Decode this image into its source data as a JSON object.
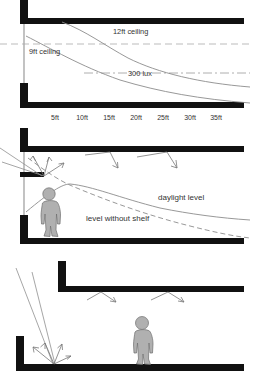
{
  "figure": {
    "background": "#ffffff",
    "wall_color": "#111111",
    "glass_color": "#9a9a9a",
    "curve_color": "#8c8c8c",
    "person_fill": "#b0b0b0",
    "person_stroke": "#6f6f6f",
    "arrow_color": "#777777"
  },
  "panels": [
    {
      "id": "panel-daylight-decay",
      "name": "daylight-decay-section",
      "labels": {
        "ceiling_12ft": "12ft ceiling",
        "ceiling_9ft": "9ft ceiling",
        "lux_line": "300 lux"
      },
      "axis": {
        "ticks": [
          "5ft",
          "10ft",
          "15ft",
          "20ft",
          "25ft",
          "30ft",
          "35ft"
        ],
        "tick_positions_px": [
          55,
          82,
          109,
          136,
          163,
          190,
          216
        ]
      },
      "curves": [
        {
          "name": "9ft ceiling daylight decay",
          "style": "solid"
        },
        {
          "name": "12ft ceiling daylight decay",
          "style": "solid"
        },
        {
          "name": "9ft ceiling datum",
          "style": "dashed"
        },
        {
          "name": "300 lux reference",
          "style": "dash-dot"
        }
      ]
    },
    {
      "id": "panel-light-shelf",
      "name": "light-shelf-section",
      "labels": {
        "daylight_level": "daylight level",
        "level_without_shelf": "level without shelf"
      },
      "curves": [
        {
          "name": "daylight level with shelf",
          "style": "solid"
        },
        {
          "name": "daylight level without shelf",
          "style": "dashed"
        }
      ],
      "elements": [
        "light-shelf",
        "occupant-figure",
        "ceiling-bounce-arrows",
        "window-glazing"
      ]
    },
    {
      "id": "panel-floor-bounce",
      "name": "floor-bounce-section",
      "labels": {},
      "elements": [
        "incoming-sun-beam",
        "floor-scatter-arrows",
        "ceiling-bounce-arrows",
        "occupant-figure"
      ]
    }
  ]
}
